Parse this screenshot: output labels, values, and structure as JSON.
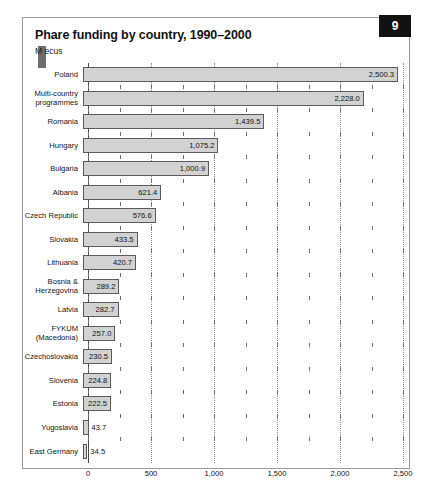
{
  "figure": {
    "badge": "9",
    "title": "Phare funding by country, 1990–2000",
    "subtitle": "M ecus"
  },
  "colors": {
    "bar_fill": "#d2d2d2",
    "bar_stroke": "#5b5b5b",
    "gridline": "#8d8d8d",
    "axis": "#4a4a4a",
    "badge_bg": "#121212",
    "badge_text": "#ffffff",
    "card_border": "#9a9a9a",
    "text": "#111111"
  },
  "chart_data": {
    "type": "bar",
    "orientation": "horizontal",
    "title": "Phare funding by country, 1990–2000",
    "subtitle": "M ecus",
    "xlabel": "",
    "ylabel": "",
    "xlim": [
      0,
      2500
    ],
    "grid": true,
    "legend": "none",
    "xticks": [
      0,
      500,
      1000,
      1500,
      2000,
      2500
    ],
    "xtick_labels": [
      "0",
      "500",
      "1,000",
      "1,500",
      "2,000",
      "2,500"
    ],
    "minor_tick_interval": 250,
    "categories": [
      "Poland",
      "Multi-country programmes",
      "Romania",
      "Hungary",
      "Bulgaria",
      "Albania",
      "Czech Republic",
      "Slovakia",
      "Lithuania",
      "Bosnia & Herzegovina",
      "Latvia",
      "FYKUM (Macedonia)",
      "Czechoslovakia",
      "Slovenia",
      "Estonia",
      "Yugoslavia",
      "East Germany"
    ],
    "values": [
      2500.3,
      2228.0,
      1439.5,
      1075.2,
      1000.9,
      621.4,
      576.6,
      433.5,
      420.7,
      289.2,
      282.7,
      257.0,
      230.5,
      224.8,
      222.5,
      43.7,
      34.5
    ],
    "value_labels": [
      "2,500.3",
      "2,228.0",
      "1,439.5",
      "1,075.2",
      "1,000.9",
      "621.4",
      "576.6",
      "433.5",
      "420.7",
      "289.2",
      "282.7",
      "257.0",
      "230.5",
      "224.8",
      "222.5",
      "43.7",
      "34.5"
    ],
    "category_label_lines": [
      [
        "Poland"
      ],
      [
        "Multi-country",
        "programmes"
      ],
      [
        "Romania"
      ],
      [
        "Hungary"
      ],
      [
        "Bulgaria"
      ],
      [
        "Albania"
      ],
      [
        "Czech Republic"
      ],
      [
        "Slovakia"
      ],
      [
        "Lithuania"
      ],
      [
        "Bosnia &",
        "Herzegovina"
      ],
      [
        "Latvia"
      ],
      [
        "FYKUM",
        "(Macedonia)"
      ],
      [
        "Czechoslovakia"
      ],
      [
        "Slovenia"
      ],
      [
        "Estonia"
      ],
      [
        "Yugoslavia"
      ],
      [
        "East Germany"
      ]
    ]
  }
}
